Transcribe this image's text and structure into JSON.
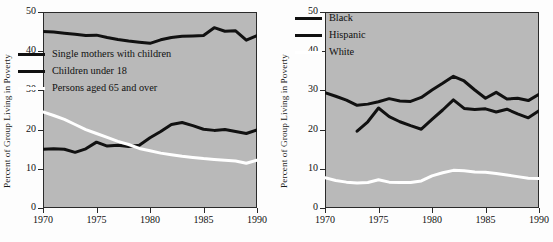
{
  "figure": {
    "background_color": "#fdfdfd",
    "plot_background_color": "#b9b9b9",
    "axis_color": "#2a2a2a"
  },
  "chart_data": [
    {
      "type": "line",
      "title": "",
      "xlabel": "",
      "ylabel": "Percent of Group Living in Poverty",
      "xlim": [
        1970,
        1990
      ],
      "ylim": [
        0,
        50
      ],
      "xticks": [
        1970,
        1975,
        1980,
        1985,
        1990
      ],
      "yticks": [
        0,
        10,
        20,
        30,
        40,
        50
      ],
      "grid": false,
      "legend_position": "upper-left-inside",
      "x": [
        1970,
        1971,
        1972,
        1973,
        1974,
        1975,
        1976,
        1977,
        1978,
        1979,
        1980,
        1981,
        1982,
        1983,
        1984,
        1985,
        1986,
        1987,
        1988,
        1989,
        1990
      ],
      "series": [
        {
          "name": "Single mothers with children",
          "color": "#111111",
          "values": [
            45.0,
            44.9,
            44.6,
            44.3,
            44.0,
            44.1,
            43.5,
            43.0,
            42.6,
            42.3,
            42.0,
            42.9,
            43.5,
            43.8,
            43.9,
            44.0,
            46.0,
            45.1,
            45.2,
            42.8,
            44.0
          ]
        },
        {
          "name": "Children under 18",
          "color": "#111111",
          "values": [
            15.0,
            15.1,
            15.0,
            14.2,
            15.1,
            16.8,
            15.8,
            16.0,
            15.7,
            16.0,
            17.9,
            19.5,
            21.3,
            21.8,
            21.0,
            20.1,
            19.8,
            20.0,
            19.5,
            19.0,
            19.9
          ]
        },
        {
          "name": "Persons aged 65 and over",
          "color": "#ffffff",
          "values": [
            24.5,
            23.6,
            22.6,
            21.3,
            20.0,
            19.0,
            18.0,
            17.0,
            16.2,
            15.2,
            14.6,
            14.0,
            13.6,
            13.2,
            12.9,
            12.6,
            12.4,
            12.2,
            12.0,
            11.4,
            12.2
          ]
        }
      ]
    },
    {
      "type": "line",
      "title": "",
      "xlabel": "",
      "ylabel": "Percent of Group Living in Poverty",
      "xlim": [
        1970,
        1990
      ],
      "ylim": [
        0,
        50
      ],
      "xticks": [
        1970,
        1975,
        1980,
        1985,
        1990
      ],
      "yticks": [
        0,
        10,
        20,
        30,
        40,
        50
      ],
      "grid": false,
      "legend_position": "upper-left-inside",
      "x": [
        1970,
        1971,
        1972,
        1973,
        1974,
        1975,
        1976,
        1977,
        1978,
        1979,
        1980,
        1981,
        1982,
        1983,
        1984,
        1985,
        1986,
        1987,
        1988,
        1989,
        1990
      ],
      "series": [
        {
          "name": "Black",
          "color": "#111111",
          "values": [
            29.4,
            28.5,
            27.5,
            26.2,
            26.5,
            27.1,
            27.9,
            27.3,
            27.2,
            28.2,
            30.1,
            31.8,
            33.6,
            32.4,
            30.1,
            28.0,
            29.5,
            27.8,
            28.0,
            27.4,
            29.0
          ]
        },
        {
          "name": "Hispanic",
          "color": "#111111",
          "values": [
            null,
            null,
            null,
            19.6,
            22.0,
            25.5,
            23.3,
            22.0,
            21.0,
            20.1,
            22.6,
            25.0,
            27.6,
            25.4,
            25.1,
            25.3,
            24.5,
            25.2,
            24.0,
            23.0,
            24.8
          ]
        },
        {
          "name": "White",
          "color": "#ffffff",
          "values": [
            7.7,
            7.0,
            6.6,
            6.4,
            6.5,
            7.2,
            6.6,
            6.5,
            6.5,
            6.9,
            8.2,
            9.0,
            9.6,
            9.5,
            9.2,
            9.1,
            8.8,
            8.4,
            8.0,
            7.6,
            7.5
          ]
        }
      ]
    }
  ],
  "left_chart": {
    "ylabel": "Percent of Group Living in Poverty",
    "yticks": [
      "0",
      "10",
      "20",
      "30",
      "40",
      "50"
    ],
    "xticks": [
      "1970",
      "1975",
      "1980",
      "1985",
      "1990"
    ],
    "legend": [
      {
        "label": "Single mothers with children",
        "color": "#111111"
      },
      {
        "label": "Children under 18",
        "color": "#111111"
      },
      {
        "label": "Persons aged 65 and over",
        "color": "#ffffff"
      }
    ]
  },
  "right_chart": {
    "ylabel": "Percent of Group Living in Poverty",
    "yticks": [
      "0",
      "10",
      "20",
      "30",
      "40",
      "50"
    ],
    "xticks": [
      "1970",
      "1975",
      "1980",
      "1985",
      "1990"
    ],
    "legend": [
      {
        "label": "Black",
        "color": "#111111"
      },
      {
        "label": "Hispanic",
        "color": "#111111"
      },
      {
        "label": "White",
        "color": "#ffffff"
      }
    ]
  }
}
